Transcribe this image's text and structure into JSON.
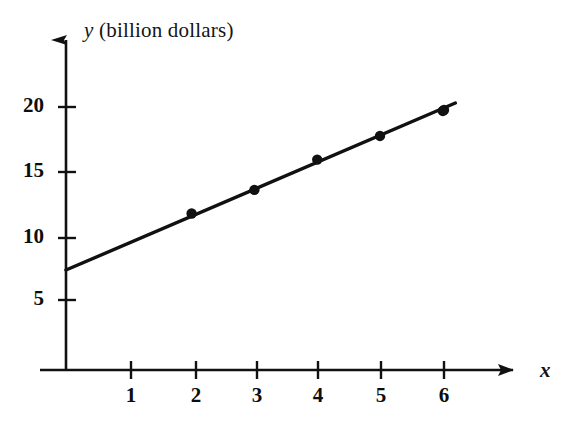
{
  "chart_data": {
    "type": "scatter",
    "title": "",
    "subtitle": "",
    "xlabel": "x",
    "ylabel": "y (billion dollars)",
    "ylabel_variable": "y",
    "ylabel_unit": "(billion dollars)",
    "xlim": [
      0,
      6.8
    ],
    "ylim": [
      0,
      21.5
    ],
    "xticks": [
      1,
      2,
      3,
      4,
      5,
      6
    ],
    "yticks": [
      5,
      10,
      15,
      20
    ],
    "xtick_labels": [
      "1",
      "2",
      "3",
      "4",
      "5",
      "6"
    ],
    "ytick_labels": [
      "5",
      "10",
      "15",
      "20"
    ],
    "grid": false,
    "legend": false,
    "legend_position": "none",
    "axis_arrows": true,
    "x": [
      1,
      2,
      3,
      4,
      5,
      6
    ],
    "values": [
      9.7,
      11.9,
      13.7,
      16.0,
      17.8,
      19.7
    ],
    "points": [
      {
        "x": 1,
        "y": 9.7
      },
      {
        "x": 2,
        "y": 11.9
      },
      {
        "x": 3,
        "y": 13.7
      },
      {
        "x": 4,
        "y": 16.0
      },
      {
        "x": 5,
        "y": 17.8
      },
      {
        "x": 6,
        "y": 19.7
      }
    ],
    "series": [
      {
        "name": "data points",
        "type": "scatter",
        "x": [
          1,
          2,
          3,
          4,
          5,
          6
        ],
        "values": [
          9.7,
          11.9,
          13.7,
          16.0,
          17.8,
          19.7
        ],
        "marker": "filled-circle",
        "color": "#111111"
      },
      {
        "name": "fitted line",
        "type": "line",
        "x": [
          0,
          6.2
        ],
        "values": [
          7.6,
          20.3
        ],
        "color": "#111111"
      }
    ],
    "trend_line": {
      "x_start": 0,
      "y_start": 7.6,
      "x_end": 6.2,
      "y_end": 20.3,
      "slope": 2.05,
      "intercept": 7.6
    },
    "annotations": []
  },
  "figure": {
    "x_axis_name": "x-axis",
    "y_axis_name": "y-axis",
    "background_color": "#ffffff",
    "ink_color": "#111111"
  }
}
